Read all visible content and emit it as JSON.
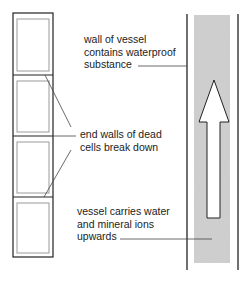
{
  "diagram": {
    "labels": {
      "wall": [
        "wall of vessel",
        "contains waterproof",
        "substance"
      ],
      "end_walls": [
        "end walls of dead",
        "cells break down"
      ],
      "vessel": [
        "vessel carries water",
        "and mineral ions",
        "upwards"
      ]
    },
    "colors": {
      "line": "#222222",
      "inner_line": "#9a9a9a",
      "vessel_fill": "#d2d2d2",
      "arrow_fill": "#ffffff"
    },
    "cells": {
      "count": 4
    },
    "arrow": {
      "direction": "up"
    }
  }
}
